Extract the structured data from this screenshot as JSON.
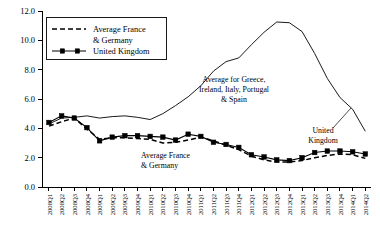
{
  "chart_data": {
    "type": "line",
    "title": "",
    "xlabel": "",
    "ylabel": "",
    "ylim": [
      0.0,
      12.0
    ],
    "yticks": [
      "0.0",
      "2.0",
      "4.0",
      "6.0",
      "8.0",
      "10.0",
      "12.0"
    ],
    "ytick_values": [
      0.0,
      2.0,
      4.0,
      6.0,
      8.0,
      10.0,
      12.0
    ],
    "grid": false,
    "legend_position": "upper-left",
    "categories": [
      "2008Q1",
      "2008Q2",
      "2008Q3",
      "2008Q4",
      "2009Q1",
      "2009Q2",
      "2009Q3",
      "2009Q4",
      "2010Q1",
      "2010Q2",
      "2010Q3",
      "2010Q4",
      "2011Q1",
      "2011Q2",
      "2011Q3",
      "2011Q4",
      "2012Q1",
      "2012Q2",
      "2012Q3",
      "2012Q4",
      "2013Q1",
      "2013Q2",
      "2013Q3",
      "2013Q4",
      "2014Q1",
      "2014Q2"
    ],
    "series": [
      {
        "name": "Average for Greece, Ireland, Italy, Portugal & Spain",
        "style": "solid-thin",
        "markers": false,
        "values": [
          4.3,
          4.7,
          4.75,
          4.85,
          4.7,
          4.8,
          4.85,
          4.75,
          4.6,
          5.0,
          5.55,
          6.15,
          6.9,
          7.9,
          8.55,
          8.8,
          9.7,
          10.55,
          11.25,
          11.2,
          10.6,
          9.1,
          7.4,
          6.1,
          5.3,
          3.8
        ]
      },
      {
        "name": "United Kingdom",
        "style": "solid-marked",
        "markers": true,
        "values": [
          4.4,
          4.85,
          4.7,
          4.05,
          3.15,
          3.4,
          3.5,
          3.5,
          3.45,
          3.4,
          3.2,
          3.6,
          3.45,
          3.05,
          2.9,
          2.7,
          2.2,
          2.05,
          1.85,
          1.8,
          2.0,
          2.35,
          2.45,
          2.45,
          2.4,
          2.25
        ]
      },
      {
        "name": "Average France & Germany",
        "style": "dashed",
        "markers": false,
        "values": [
          4.15,
          4.45,
          4.7,
          3.95,
          3.25,
          3.35,
          3.35,
          3.3,
          3.25,
          3.0,
          3.05,
          3.2,
          3.4,
          3.15,
          2.85,
          2.55,
          2.1,
          1.85,
          1.7,
          1.7,
          1.8,
          2.0,
          2.15,
          2.25,
          2.2,
          1.95
        ]
      }
    ],
    "annotations": [
      {
        "id": "annot-giips",
        "lines": [
          "Average for Greece,",
          "Ireland, Italy, Portugal",
          "& Spain"
        ]
      },
      {
        "id": "annot-france-germany",
        "lines": [
          "Average France",
          "& Germany"
        ]
      },
      {
        "id": "annot-uk",
        "lines": [
          "United",
          "Kingdom"
        ]
      }
    ],
    "legend": [
      {
        "label": "Average France",
        "label2": "& Germany",
        "style": "dashed"
      },
      {
        "label": "United Kingdom",
        "label2": "",
        "style": "solid-marked"
      }
    ]
  },
  "colors": {
    "ink": "#000000",
    "background": "#ffffff"
  }
}
